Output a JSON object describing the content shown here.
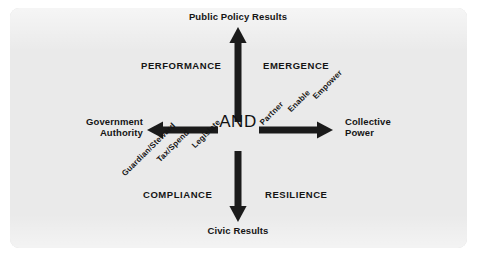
{
  "diagram": {
    "title_text": "AND",
    "axes": {
      "vertical": {
        "top_label": "Public Policy Results",
        "bottom_label": "Civic Results"
      },
      "horizontal": {
        "left_label_line1": "Government",
        "left_label_line2": "Authority",
        "right_label_line1": "Collective",
        "right_label_line2": "Power"
      }
    },
    "quadrants": [
      {
        "id": "top-left",
        "label": "PERFORMANCE"
      },
      {
        "id": "top-right",
        "label": "EMERGENCE"
      },
      {
        "id": "bottom-left",
        "label": "COMPLIANCE"
      },
      {
        "id": "bottom-right",
        "label": "RESILIENCE"
      }
    ],
    "diagonal_labels": {
      "upper_right": [
        "Partner",
        "Enable",
        "Empower"
      ],
      "lower_left": [
        "Guardian/Steward",
        "Tax/Spend",
        "Legislate"
      ]
    },
    "colors": {
      "arrow": "#1b1b1b",
      "text": "#151515",
      "panel_background": "#eaeaea",
      "page_background": "#ffffff"
    }
  }
}
